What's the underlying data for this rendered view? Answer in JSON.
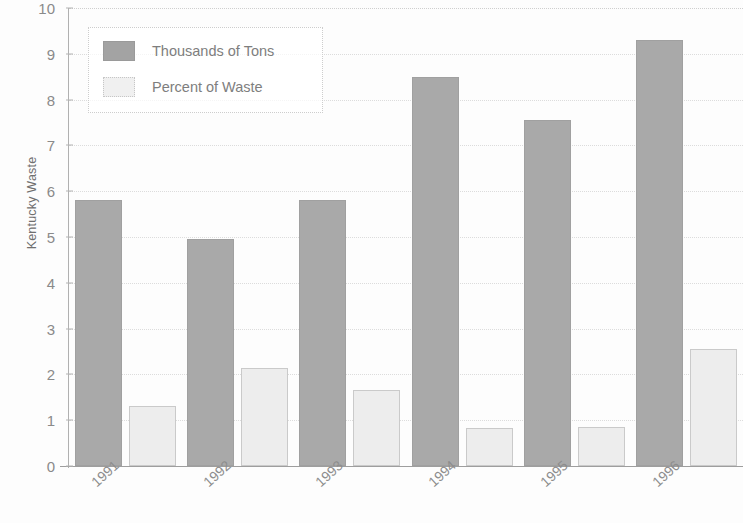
{
  "chart_data": {
    "type": "bar",
    "title": "",
    "xlabel": "",
    "ylabel": "Kentucky Waste",
    "categories": [
      "1991",
      "1992",
      "1993",
      "1994",
      "1995",
      "1996"
    ],
    "series": [
      {
        "name": "Thousands of Tons",
        "color": "#a9a9a9",
        "values": [
          5.8,
          4.95,
          5.8,
          8.5,
          7.55,
          9.3
        ]
      },
      {
        "name": "Percent of Waste",
        "color": "#ededed",
        "values": [
          1.3,
          2.15,
          1.65,
          0.82,
          0.85,
          2.55
        ]
      }
    ],
    "ylim": [
      0,
      10
    ],
    "ytick_labels": [
      "0",
      "1",
      "2",
      "3",
      "4",
      "5",
      "6",
      "7",
      "8",
      "9",
      "10"
    ],
    "ytick_values": [
      0,
      1,
      2,
      3,
      4,
      5,
      6,
      7,
      8,
      9,
      10
    ],
    "grid": true,
    "grid_axis": "y",
    "legend_position": "top-left"
  }
}
